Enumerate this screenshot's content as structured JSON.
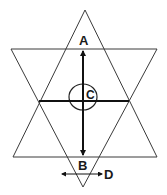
{
  "diagram": {
    "labels": {
      "a": "A",
      "b": "B",
      "c": "C",
      "d": "D"
    },
    "colors": {
      "stroke": "#3a3a3a",
      "axis": "#111111",
      "text": "#1a1a1a",
      "background": "#ffffff"
    },
    "shapes": {
      "upright_triangle": [
        [
          85,
          10
        ],
        [
          13,
          157
        ],
        [
          157,
          157
        ]
      ],
      "inverted_triangle": [
        [
          11,
          49
        ],
        [
          157,
          49
        ],
        [
          83,
          187
        ]
      ],
      "circle": {
        "cx": 83,
        "cy": 97,
        "rx": 14,
        "ry": 13
      },
      "vertical_arrow": {
        "x": 83,
        "y1": 50,
        "y2": 155
      },
      "horizontal_line": {
        "y": 101,
        "x1": 39,
        "x2": 129
      },
      "small_arrow": {
        "y": 174,
        "x1": 62,
        "x2": 102
      }
    }
  }
}
